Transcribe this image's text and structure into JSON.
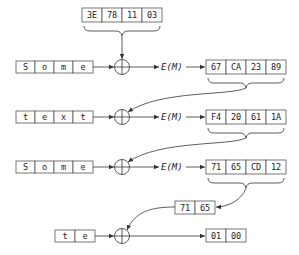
{
  "diagram": {
    "type": "cbc-ciphertext-stealing",
    "iv": {
      "cells": [
        "3E",
        "78",
        "11",
        "03"
      ]
    },
    "rows": [
      {
        "plaintext": [
          "S",
          "o",
          "m",
          "e"
        ],
        "op": "E(M)",
        "ciphertext": [
          "67",
          "CA",
          "23",
          "89"
        ]
      },
      {
        "plaintext": [
          "t",
          "e",
          "x",
          "t"
        ],
        "op": "E(M)",
        "ciphertext": [
          "F4",
          "20",
          "61",
          "1A"
        ]
      },
      {
        "plaintext": [
          "S",
          "o",
          "m",
          "e"
        ],
        "op": "E(M)",
        "ciphertext": [
          "71",
          "65",
          "CD",
          "12"
        ]
      }
    ],
    "partial_key": {
      "cells": [
        "71",
        "65"
      ]
    },
    "final": {
      "plaintext": [
        "t",
        "e"
      ],
      "ciphertext": [
        "01",
        "00"
      ]
    },
    "xor_symbol": "xor-circle-plus",
    "colors": {
      "stroke": "#555555",
      "text": "#222222",
      "background": "#ffffff"
    }
  }
}
